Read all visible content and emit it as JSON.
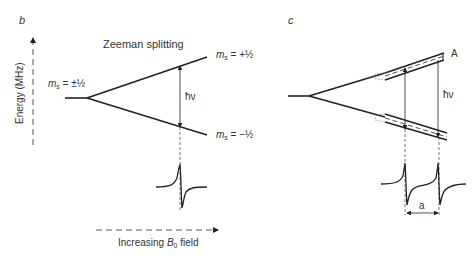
{
  "panels": {
    "b": {
      "letter": "b",
      "title": "Zeeman splitting",
      "y_axis_label": "Energy (MHz)",
      "x_axis_label_prefix": "Increasing ",
      "x_axis_label_var": "B",
      "x_axis_label_sub": "0",
      "x_axis_label_suffix": " field",
      "level_degenerate": {
        "var": "m",
        "sub": "s",
        "value": " = ±½"
      },
      "level_upper": {
        "var": "m",
        "sub": "s",
        "value": " = +½"
      },
      "level_lower": {
        "var": "m",
        "sub": "s",
        "value": " = −½"
      },
      "transition_label": "ħν"
    },
    "c": {
      "letter": "c",
      "hyperfine_label": "A",
      "transition_label": "ħν",
      "spacing_label": "a"
    }
  }
}
